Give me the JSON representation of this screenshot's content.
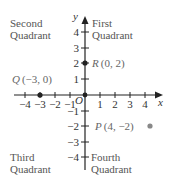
{
  "diagram": {
    "type": "cartesian-coordinate-plane",
    "axes": {
      "x_label": "x",
      "y_label": "y",
      "origin_label": "O",
      "x_ticks": [
        "−4",
        "−3",
        "−2",
        "−1",
        "1",
        "2",
        "3",
        "4"
      ],
      "y_ticks_positive": [
        "4",
        "3",
        "2",
        "1"
      ],
      "y_ticks_negative": [
        "−1",
        "−2",
        "−3",
        "−4"
      ]
    },
    "quadrants": {
      "first": {
        "line1": "First",
        "line2": "Quadrant"
      },
      "second": {
        "line1": "Second",
        "line2": "Quadrant"
      },
      "third": {
        "line1": "Third",
        "line2": "Quadrant"
      },
      "fourth": {
        "line1": "Fourth",
        "line2": "Quadrant"
      }
    },
    "points": [
      {
        "name": "R",
        "coords": "(0, 2)",
        "x": 0,
        "y": 2
      },
      {
        "name": "Q",
        "coords": "(−3, 0)",
        "x": -3,
        "y": 0
      },
      {
        "name": "P",
        "coords": "(4, −2)",
        "x": 4,
        "y": -2
      }
    ],
    "colors": {
      "axis": "#222222",
      "text": "#555555",
      "point_dark": "#222222",
      "point_gray": "#888888"
    }
  }
}
